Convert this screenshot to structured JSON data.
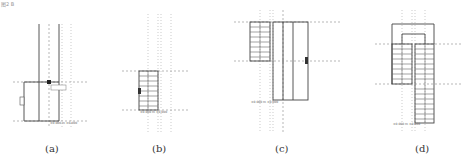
{
  "figure": {
    "corner_note": "图2 B",
    "panels": [
      {
        "id": "a",
        "caption": "(a)",
        "label_box": "0.0 / 0.0",
        "dim_label": "2800",
        "elev_label": "±0.000 m ±0.000"
      },
      {
        "id": "b",
        "caption": "(b)",
        "dim_label": "2.3",
        "elev_label": "±0.000 m ±0.000"
      },
      {
        "id": "c",
        "caption": "(c)",
        "dim_label": "1.5",
        "elev_label": "±0.000 m ±0.000"
      },
      {
        "id": "d",
        "caption": "(d)",
        "elev_label": "±0.000 m ±0.000"
      }
    ]
  }
}
